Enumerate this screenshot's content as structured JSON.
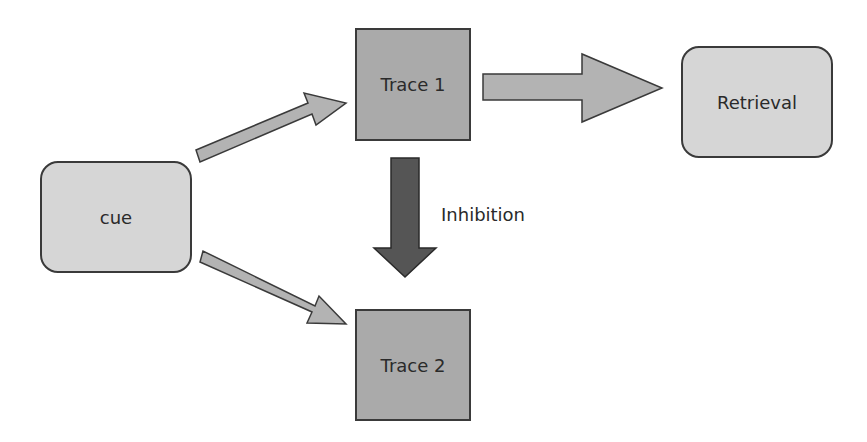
{
  "diagram": {
    "nodes": {
      "cue": {
        "label": "cue",
        "shape": "rounded-rect",
        "fill": "#d6d6d6"
      },
      "trace1": {
        "label": "Trace 1",
        "shape": "rect",
        "fill": "#aaaaaa"
      },
      "trace2": {
        "label": "Trace 2",
        "shape": "rect",
        "fill": "#aaaaaa"
      },
      "retrieval": {
        "label": "Retrieval",
        "shape": "rounded-rect",
        "fill": "#d6d6d6"
      }
    },
    "edges": [
      {
        "from": "cue",
        "to": "trace1",
        "style": "light-arrow"
      },
      {
        "from": "cue",
        "to": "trace2",
        "style": "light-arrow"
      },
      {
        "from": "trace1",
        "to": "retrieval",
        "style": "large-light-arrow"
      },
      {
        "from": "trace1",
        "to": "trace2",
        "style": "dark-arrow",
        "label": "Inhibition"
      }
    ],
    "edge_labels": {
      "inhibition": "Inhibition"
    },
    "colors": {
      "light_arrow": "#b3b3b3",
      "dark_arrow": "#555555",
      "outline": "#3a3a3a"
    }
  }
}
